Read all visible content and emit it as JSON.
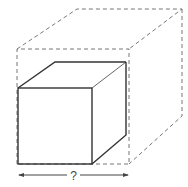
{
  "diagram": {
    "inner_shape": "cube (solid outline)",
    "outer_shape": "cube (dashed outline)",
    "dimension_label": "?"
  }
}
